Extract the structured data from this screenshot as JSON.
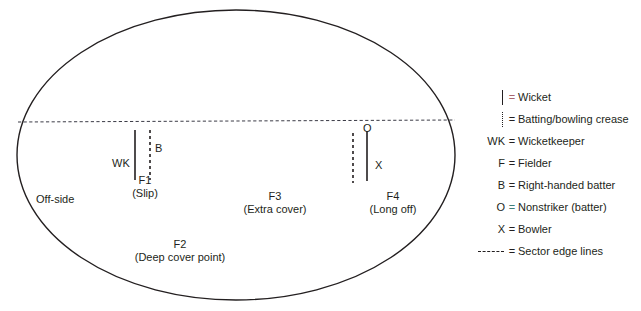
{
  "diagram": {
    "field": {
      "boundary_shape": "ellipse",
      "sector_line_label": "Sector edge line",
      "labels": {
        "off_side": "Off-side",
        "wicketkeeper": "WK",
        "fielder_1": "F1",
        "fielder_1_name": "(Slip)",
        "fielder_2": "F2",
        "fielder_2_name": "(Deep cover point)",
        "fielder_3": "F3",
        "fielder_3_name": "(Extra cover)",
        "fielder_4": "F4",
        "fielder_4_name": "(Long off)",
        "batter": "B",
        "nonstriker": "O",
        "bowler": "X"
      }
    },
    "legend": {
      "rows": [
        {
          "symbol_kind": "wicket",
          "symbol_text": "",
          "equals": "=",
          "tint": "red",
          "text": "Wicket"
        },
        {
          "symbol_kind": "crease",
          "symbol_text": "",
          "equals": "=",
          "tint": "none",
          "text": "Batting/bowling crease"
        },
        {
          "symbol_kind": "text",
          "symbol_text": "WK",
          "equals": "=",
          "tint": "none",
          "text": "Wicketkeeper"
        },
        {
          "symbol_kind": "text",
          "symbol_text": "F",
          "equals": "=",
          "tint": "none",
          "text": "Fielder"
        },
        {
          "symbol_kind": "text",
          "symbol_text": "B",
          "equals": "=",
          "tint": "none",
          "text": "Right-handed batter"
        },
        {
          "symbol_kind": "text",
          "symbol_text": "O",
          "equals": "=",
          "tint": "teal",
          "text": "Nonstriker (batter)"
        },
        {
          "symbol_kind": "text",
          "symbol_text": "X",
          "equals": "=",
          "tint": "none",
          "text": "Bowler"
        },
        {
          "symbol_kind": "sector",
          "symbol_text": "",
          "equals": "=",
          "tint": "none",
          "text": "Sector edge lines"
        }
      ]
    },
    "colors": {
      "ink": "#231f20",
      "background": "#ffffff",
      "tint_red": "#a8656f",
      "tint_teal": "#3f7f7a"
    }
  }
}
